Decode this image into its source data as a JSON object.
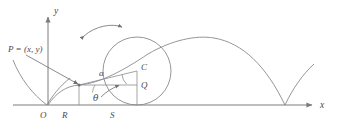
{
  "figure": {
    "background_color": "#ffffff",
    "curve_color": "#8a8a8a",
    "axis_color": "#7c7c7c",
    "label_color": "#4a4a4a"
  },
  "axes": {
    "x_label": "x",
    "y_label": "y",
    "origin_label": "O"
  },
  "points": {
    "p_label": "P = (x, y)",
    "c_label": "C",
    "q_label": "Q",
    "r_label": "R",
    "s_label": "S",
    "radius_label": "a",
    "angle_label": "θ"
  },
  "geometry": {
    "circle_center_x": 137,
    "circle_center_y": 71,
    "circle_radius": 34,
    "baseline_y": 105,
    "y_axis_x": 48,
    "origin_x": 48,
    "point_p_x": 79,
    "point_p_y": 85,
    "point_q_x": 137,
    "point_q_y": 85,
    "point_r_x": 79,
    "point_s_x": 137,
    "right_cusp_x": 285,
    "arch_apex_y": 38
  },
  "annotations": {
    "rotation_arrow": "rotation-direction-arrow",
    "leader_line": "p-label-leader"
  }
}
